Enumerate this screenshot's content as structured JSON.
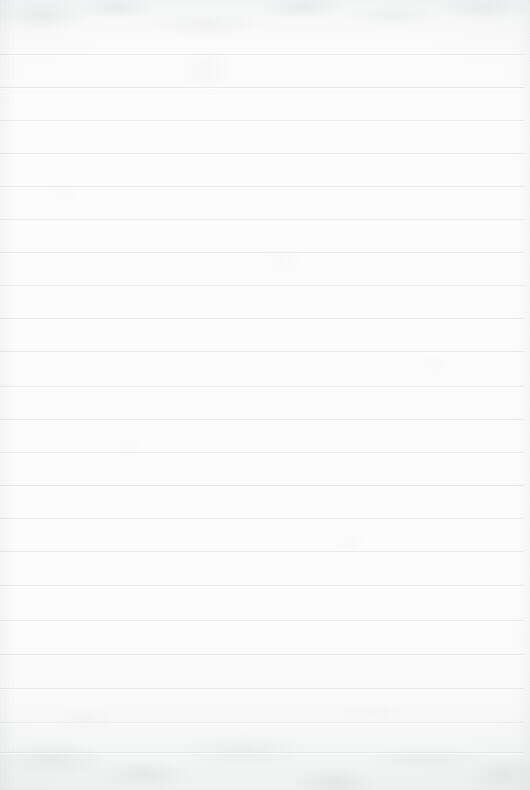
{
  "document": {
    "type": "lined-paper",
    "title": "Blank Lined Paper Page",
    "content_text": "",
    "handwriting": "",
    "page_number": "",
    "is_blank": true
  },
  "paper": {
    "width_px": 530,
    "height_px": 790,
    "background_color": "#fdfdfd",
    "edge_tint_color": "#f1f2f3",
    "texture": "mottled-scan-grain",
    "vignette": "soft-edge-darkening"
  },
  "ruling": {
    "style": "horizontal-ruled",
    "line_color": "#e4e6e7",
    "line_thickness_px": 1,
    "line_spacing_px": 33,
    "first_line_y_px": 54,
    "line_start_x_px": 0,
    "line_end_x_px": 524,
    "line_count": 22,
    "has_left_margin_rule": false,
    "margin_rule_color": "",
    "line_y_positions": [
      54,
      87,
      120,
      153,
      186,
      219,
      252,
      285,
      318,
      351,
      386,
      419,
      452,
      485,
      518,
      551,
      585,
      620,
      654,
      688,
      722,
      752
    ]
  }
}
